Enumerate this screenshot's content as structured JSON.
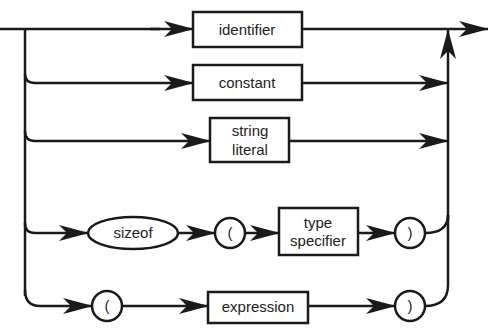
{
  "diagram": {
    "type": "syntax-diagram",
    "stroke_color": "#1a1a1a",
    "background": "#ffffff",
    "nodes": {
      "identifier": {
        "label": "identifier",
        "shape": "rectangle"
      },
      "constant": {
        "label": "constant",
        "shape": "rectangle"
      },
      "string_literal": {
        "line1": "string",
        "line2": "literal",
        "shape": "rectangle"
      },
      "sizeof": {
        "label": "sizeof",
        "shape": "ellipse"
      },
      "lparen1": {
        "label": "(",
        "shape": "circle"
      },
      "type_specifier": {
        "line1": "type",
        "line2": "specifier",
        "shape": "rectangle"
      },
      "rparen1": {
        "label": ")",
        "shape": "circle"
      },
      "lparen2": {
        "label": "(",
        "shape": "circle"
      },
      "expression": {
        "label": "expression",
        "shape": "rectangle"
      },
      "rparen2": {
        "label": ")",
        "shape": "circle"
      }
    },
    "paths": [
      [
        "identifier"
      ],
      [
        "constant"
      ],
      [
        "string_literal"
      ],
      [
        "sizeof",
        "lparen1",
        "type_specifier",
        "rparen1"
      ],
      [
        "lparen2",
        "expression",
        "rparen2"
      ]
    ]
  }
}
